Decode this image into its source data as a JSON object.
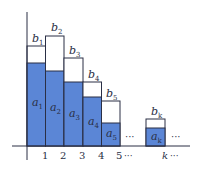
{
  "diagram": {
    "type": "comparison-bar-diagram",
    "colors": {
      "a_fill": "#5b86d6",
      "b_fill": "#ffffff",
      "stroke": "#2a2f45",
      "axis": "#2a2f45"
    },
    "x_ticks": [
      "1",
      "2",
      "3",
      "4",
      "5",
      "k"
    ],
    "ellipsis": "···",
    "bars": [
      {
        "index": "1",
        "a_label": "a",
        "a_sub": "1",
        "b_label": "b",
        "b_sub": "1"
      },
      {
        "index": "2",
        "a_label": "a",
        "a_sub": "2",
        "b_label": "b",
        "b_sub": "2"
      },
      {
        "index": "3",
        "a_label": "a",
        "a_sub": "3",
        "b_label": "b",
        "b_sub": "3"
      },
      {
        "index": "4",
        "a_label": "a",
        "a_sub": "4",
        "b_label": "b",
        "b_sub": "4"
      },
      {
        "index": "5",
        "a_label": "a",
        "a_sub": "5",
        "b_label": "b",
        "b_sub": "5"
      },
      {
        "index": "k",
        "a_label": "a",
        "a_sub": "k",
        "b_label": "b",
        "b_sub": "k"
      }
    ]
  }
}
